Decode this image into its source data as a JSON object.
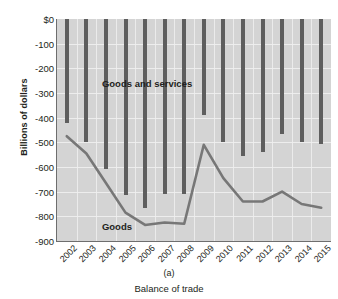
{
  "chart_data": {
    "type": "bar",
    "title": "",
    "subtitle": "",
    "xlabel": "Balance of trade",
    "ylabel": "Billions of dollars",
    "panel_letter": "(a)",
    "grid": true,
    "legend_position": "inline-annotation",
    "ylim": [
      -900,
      0
    ],
    "yticks": [
      0,
      -100,
      -200,
      -300,
      -400,
      -500,
      -600,
      -700,
      -800,
      -900
    ],
    "ytick_labels": [
      "$0",
      "-100",
      "-200",
      "-300",
      "-400",
      "-500",
      "-600",
      "-700",
      "-800",
      "-900"
    ],
    "categories": [
      "2002",
      "2003",
      "2004",
      "2005",
      "2006",
      "2007",
      "2008",
      "2009",
      "2010",
      "2011",
      "2012",
      "2013",
      "2014",
      "2015"
    ],
    "series": [
      {
        "name": "Goods and services",
        "type": "bar",
        "color": "#5e5e5e",
        "values": [
          -420,
          -500,
          -610,
          -715,
          -765,
          -710,
          -710,
          -390,
          -500,
          -555,
          -540,
          -465,
          -500,
          -505
        ]
      },
      {
        "name": "Goods",
        "type": "line",
        "color": "#777777",
        "values": [
          -475,
          -545,
          -665,
          -785,
          -835,
          -825,
          -830,
          -510,
          -645,
          -740,
          -740,
          -700,
          -750,
          -765
        ]
      }
    ],
    "annotations": [
      {
        "text": "Goods and services",
        "x": "2004",
        "y": -265
      },
      {
        "text": "Goods",
        "x": "2004",
        "y": -845
      }
    ]
  },
  "colors": {
    "plot_background": "#d4d4d4",
    "gridline": "#efefef",
    "axis": "#6e6e6e",
    "bar": "#5e5e5e",
    "line": "#777777",
    "text": "#231f20"
  }
}
